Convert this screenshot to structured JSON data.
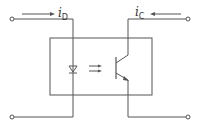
{
  "diagram": {
    "type": "optocoupler-circuit",
    "labels": {
      "input_current": {
        "main": "i",
        "sub": "D"
      },
      "output_current": {
        "main": "i",
        "sub": "C"
      }
    },
    "components": {
      "package_box": "optocoupler-package",
      "emitter": "LED (diode)",
      "light_coupling": "double arrows",
      "detector": "phototransistor"
    },
    "terminals": [
      "input-top",
      "input-bottom",
      "output-top",
      "output-bottom"
    ],
    "colors": {
      "stroke": "#555555",
      "background": "#ffffff"
    }
  }
}
